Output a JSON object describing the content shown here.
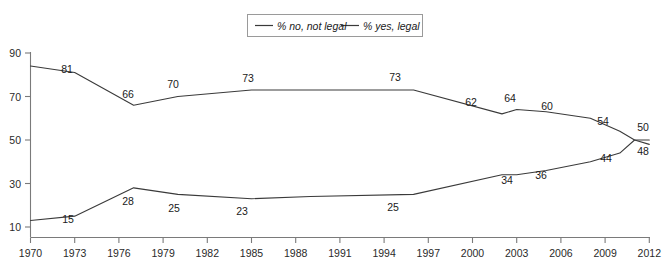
{
  "chart_data": {
    "type": "line",
    "title": "",
    "xlabel": "",
    "ylabel": "",
    "xlim": [
      1970,
      2013
    ],
    "ylim": [
      5,
      92
    ],
    "yticks": [
      10,
      30,
      50,
      70,
      90
    ],
    "xticks": [
      1970,
      1973,
      1976,
      1979,
      1982,
      1985,
      1988,
      1991,
      1994,
      1997,
      2000,
      2003,
      2006,
      2009,
      2012
    ],
    "grid": false,
    "legend_position": "top-center",
    "series": [
      {
        "name": "% no, not legal",
        "color": "#3a3a3a",
        "x": [
          1970,
          1973,
          1977,
          1980,
          1985,
          1989,
          1996,
          2002,
          2003,
          2005,
          2008,
          2010,
          2011,
          2012
        ],
        "values": [
          84,
          81,
          66,
          70,
          73,
          73,
          73,
          62,
          64,
          63,
          60,
          54,
          50,
          48
        ],
        "labels": [
          {
            "x": 1973,
            "value": 81
          },
          {
            "x": 1977,
            "value": 66
          },
          {
            "x": 1980,
            "value": 70
          },
          {
            "x": 1985,
            "value": 73
          },
          {
            "x": 1996,
            "value": 73
          },
          {
            "x": 2002,
            "value": 62
          },
          {
            "x": 2003,
            "value": 64
          },
          {
            "x": 2006,
            "value": 60
          },
          {
            "x": 2010,
            "value": 54
          },
          {
            "x": 2012,
            "value": 48
          }
        ]
      },
      {
        "name": "% yes, legal",
        "color": "#3a3a3a",
        "x": [
          1970,
          1973,
          1977,
          1980,
          1985,
          1989,
          1996,
          2002,
          2003,
          2005,
          2008,
          2010,
          2011,
          2012
        ],
        "values": [
          13,
          15,
          28,
          25,
          23,
          24,
          25,
          34,
          34,
          36,
          40,
          44,
          50,
          50
        ],
        "labels": [
          {
            "x": 1973,
            "value": 15
          },
          {
            "x": 1977,
            "value": 28
          },
          {
            "x": 1980,
            "value": 25
          },
          {
            "x": 1985,
            "value": 23
          },
          {
            "x": 1996,
            "value": 25
          },
          {
            "x": 2003,
            "value": 34
          },
          {
            "x": 2005,
            "value": 36
          },
          {
            "x": 2010,
            "value": 44
          },
          {
            "x": 2012,
            "value": 50
          }
        ]
      }
    ]
  },
  "legend": {
    "items": [
      {
        "label": "% no, not legal"
      },
      {
        "label": "% yes, legal"
      }
    ]
  },
  "axis": {
    "y_labels": [
      "90",
      "70",
      "50",
      "30",
      "10"
    ],
    "x_labels": [
      "1970",
      "1973",
      "1976",
      "1979",
      "1982",
      "1985",
      "1988",
      "1991",
      "1994",
      "1997",
      "2000",
      "2003",
      "2006",
      "2009",
      "2012"
    ]
  },
  "point_labels": {
    "no_line": [
      "81",
      "66",
      "70",
      "73",
      "73",
      "62",
      "64",
      "60",
      "54",
      "48"
    ],
    "yes_line": [
      "15",
      "28",
      "25",
      "23",
      "25",
      "34",
      "36",
      "44",
      "50"
    ]
  }
}
